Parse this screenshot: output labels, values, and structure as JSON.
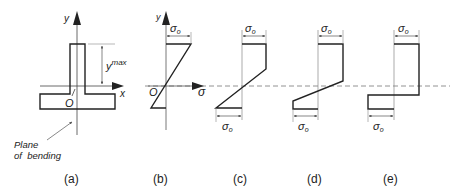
{
  "panels": [
    {
      "id": "a",
      "caption": "(a)",
      "axis_y_label": "y",
      "axis_x_label": "x",
      "origin_label": "O",
      "dimension_label": "y",
      "dimension_sup": "max",
      "callout": [
        "Plane",
        "of  bending"
      ]
    },
    {
      "id": "b",
      "caption": "(b)",
      "axis_y_label": "y",
      "axis_x_label": "σ",
      "origin_label": "O",
      "top_label": "σ",
      "top_sub": "o"
    },
    {
      "id": "c",
      "caption": "(c)",
      "top_label": "σ",
      "top_sub": "o",
      "bottom_label": "σ",
      "bottom_sub": "o"
    },
    {
      "id": "d",
      "caption": "(d)",
      "top_label": "σ",
      "top_sub": "o",
      "bottom_label": "σ",
      "bottom_sub": "o"
    },
    {
      "id": "e",
      "caption": "(e)",
      "top_label": "σ",
      "top_sub": "o",
      "bottom_label": "σ",
      "bottom_sub": "o"
    }
  ],
  "colors": {
    "line": "#222222",
    "thin": "#555555",
    "dash": "#777777"
  }
}
